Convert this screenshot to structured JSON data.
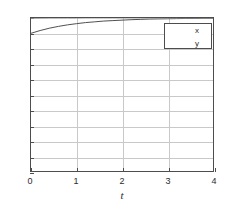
{
  "chart_data": {
    "type": "line",
    "title": "",
    "xlabel": "t",
    "ylabel": "",
    "xlim": [
      0,
      4
    ],
    "ylim": [
      0,
      1
    ],
    "grid": true,
    "legend_position": "top-right",
    "x_ticks": [
      "0",
      "1",
      "2",
      "3",
      "4"
    ],
    "x_tick_values": [
      0,
      1,
      2,
      3,
      4
    ],
    "y_ticks": [
      "0",
      "0.1",
      "0.2",
      "0.3",
      "0.4",
      "0.5",
      "0.6",
      "0.7",
      "0.8",
      "0.9",
      "1"
    ],
    "y_tick_values": [
      0,
      0.1,
      0.2,
      0.3,
      0.4,
      0.5,
      0.6,
      0.7,
      0.8,
      0.9,
      1
    ],
    "x": [
      0,
      0.2,
      0.4,
      0.6,
      0.8,
      1.0,
      1.2,
      1.4,
      1.6,
      1.8,
      2.0,
      2.2,
      2.4,
      2.6,
      2.8,
      3.0,
      3.2,
      3.4,
      3.6,
      3.8,
      4.0
    ],
    "series": [
      {
        "name": "x",
        "color": "#4d4d4d",
        "values": [
          0.9,
          0.918,
          0.933,
          0.945,
          0.955,
          0.963,
          0.97,
          0.975,
          0.98,
          0.983,
          0.986,
          0.989,
          0.991,
          0.993,
          0.994,
          0.995,
          0.996,
          0.997,
          0.997,
          0.998,
          0.998
        ]
      },
      {
        "name": "y",
        "color": "#9a9a9a",
        "values": [
          0.998,
          0.998,
          0.999,
          0.999,
          0.999,
          0.999,
          1.0,
          1.0,
          1.0,
          1.0,
          1.0,
          1.0,
          1.0,
          1.0,
          1.0,
          1.0,
          1.0,
          1.0,
          1.0,
          1.0,
          1.0
        ]
      }
    ]
  },
  "legend": {
    "items": [
      {
        "label": "x"
      },
      {
        "label": "y"
      }
    ]
  },
  "colors": {
    "axis": "#4d4d4d",
    "grid": "#c9c9c9",
    "series_x": "#4d4d4d",
    "series_y": "#9a9a9a",
    "background": "#ffffff"
  }
}
